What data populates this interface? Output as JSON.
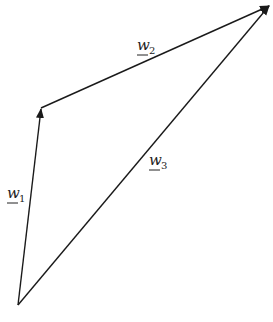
{
  "diagram": {
    "points": {
      "origin": [
        18,
        305
      ],
      "w1_tip": [
        41,
        108
      ],
      "w2_tip": [
        270,
        5
      ]
    },
    "vectors": [
      {
        "name": "w1",
        "label": "w",
        "subscript": "1",
        "from": "origin",
        "to": "w1_tip"
      },
      {
        "name": "w2",
        "label": "w",
        "subscript": "2",
        "from": "w1_tip",
        "to": "w2_tip"
      },
      {
        "name": "w3",
        "label": "w",
        "subscript": "3",
        "from": "origin",
        "to": "w2_tip"
      }
    ],
    "line_color": "#1a1a1a"
  },
  "caption": {
    "text": ""
  }
}
